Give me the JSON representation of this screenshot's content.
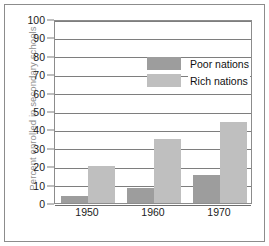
{
  "chart_data": {
    "type": "bar",
    "title": "",
    "xlabel": "",
    "ylabel": "Percent enrolled in secondary schools",
    "categories": [
      "1950",
      "1960",
      "1970"
    ],
    "series": [
      {
        "name": "Poor nations",
        "values": [
          4,
          8,
          15
        ],
        "color": "#9d9d9d"
      },
      {
        "name": "Rich nations",
        "values": [
          20,
          35,
          44
        ],
        "color": "#bfbfbf"
      }
    ],
    "ylim": [
      0,
      100
    ],
    "yticks": [
      0,
      10,
      20,
      30,
      40,
      50,
      60,
      70,
      80,
      90,
      100
    ],
    "ytick_labels": [
      "0",
      "10",
      "20",
      "30",
      "40",
      "50",
      "60",
      "70",
      "80",
      "90",
      "100"
    ],
    "grid": true,
    "grid_axis": "y",
    "legend_position": "upper-left-inside",
    "legend": [
      "Poor nations",
      "Rich nations"
    ]
  }
}
